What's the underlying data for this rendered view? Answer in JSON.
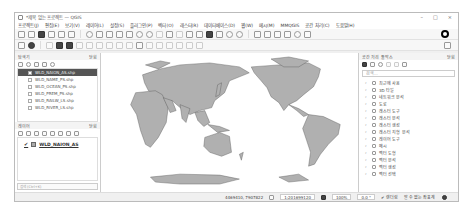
{
  "window": {
    "title": "*제목 없는 프로젝트 — QGIS",
    "controls": [
      "–",
      "□",
      "×"
    ]
  },
  "menubar": {
    "items": [
      "프로젝트(J)",
      "편집(E)",
      "보기(V)",
      "레이어(L)",
      "설정(S)",
      "플러그인(P)",
      "벡터(O)",
      "래스터(R)",
      "데이터베이스(D)",
      "웹(W)",
      "메시(M)",
      "MMQGIS",
      "공간 처리(C)",
      "도움말(H)"
    ]
  },
  "layers_panel": {
    "title": "탐색기",
    "close_label": "닫힘",
    "items": [
      {
        "label": "WLD_NAION_AS.shp",
        "selected": true
      },
      {
        "label": "WLD_NAME_PS.shp",
        "selected": false
      },
      {
        "label": "WLD_OCEAN_PS.shp",
        "selected": false
      },
      {
        "label": "WLD_PREM_PS.shp",
        "selected": false
      },
      {
        "label": "WLD_RAILW_LS.shp",
        "selected": false
      },
      {
        "label": "WLD_RIVER_LS.shp",
        "selected": false
      }
    ]
  },
  "legend_panel": {
    "title": "레이어",
    "close_label": "닫힘",
    "layers": [
      {
        "label": "WLD_NAION_AS",
        "checked": true,
        "color": "#aaaaaa"
      }
    ]
  },
  "locator": {
    "placeholder": "검색 (Ctrl+K)"
  },
  "processing_panel": {
    "title": "공간 처리 툴박스",
    "close_label": "닫힘",
    "search_placeholder": "검색...",
    "items": [
      "최근에 사용",
      "3D 타일",
      "네트워크 분석",
      "도로",
      "래스터 도구",
      "래스터 분석",
      "래스터 생성",
      "래스터 지형 분석",
      "레이어 도구",
      "메시",
      "벡터 도형",
      "벡터 분석",
      "벡터 생성",
      "벡터 선택"
    ]
  },
  "map": {
    "land_color": "#b0b0b0",
    "border_color": "#555555",
    "background": "#ffffff"
  },
  "statusbar": {
    "coordinate_label": "좌표",
    "coordinate": "4469410, 7907822",
    "scale": "1:201699120",
    "magnifier": "100%",
    "rotation": "0.0 °",
    "render_label": "렌더링",
    "crs_label": "알 수 없는 좌표계"
  }
}
